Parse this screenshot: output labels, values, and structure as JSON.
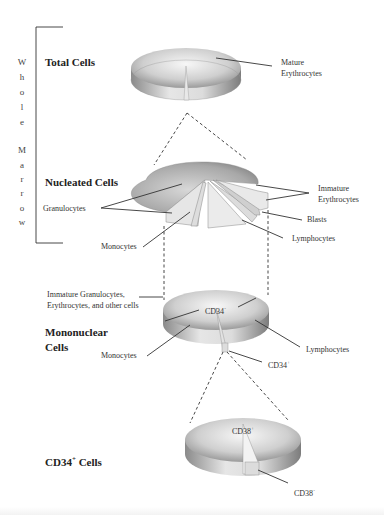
{
  "side_bracket": {
    "letters": [
      "W",
      "h",
      "o",
      "l",
      "e",
      "",
      "M",
      "a",
      "r",
      "r",
      "o",
      "w"
    ]
  },
  "levels": [
    {
      "title": "Total Cells",
      "labels": [
        "Mature Erythrocytes"
      ]
    },
    {
      "title": "Nucleated Cells",
      "labels": [
        "Granulocytes",
        "Monocytes",
        "Immature Erythrocytes",
        "Blasts",
        "Lymphocytes"
      ]
    },
    {
      "title_line1": "Mononuclear",
      "title_line2": "Cells",
      "labels": [
        "Immature Granulocytes,",
        "Erythrocytes, and other cells",
        "CD34",
        "Monocytes",
        "Lymphocytes",
        "CD34"
      ],
      "sup_minus": "-",
      "sup_plus": "+"
    },
    {
      "title_pre": "CD34",
      "title_sup": "+",
      "title_post": " Cells",
      "labels": [
        "CD38",
        "CD38"
      ],
      "sup_plus": "+",
      "sup_minus": "-"
    }
  ],
  "colors": {
    "pie_top_light": "#f2f2f2",
    "pie_top_dark": "#9a9a9a",
    "pie_side": "#bdbdbd",
    "slice_highlight": "#e9e9e9",
    "line": "#333333"
  }
}
